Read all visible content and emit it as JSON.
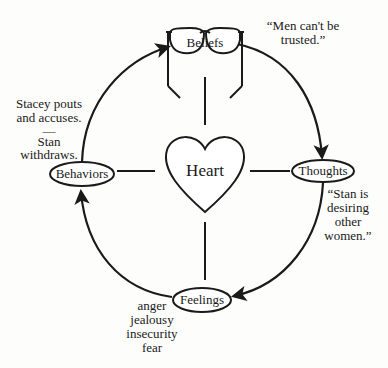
{
  "diagram": {
    "center": {
      "label": "Heart",
      "shape": "heart"
    },
    "nodes": [
      {
        "id": "beliefs",
        "label": "Beliefs",
        "shape": "eyeglasses",
        "annotation": [
          "“Men can't be",
          "trusted.”"
        ]
      },
      {
        "id": "thoughts",
        "label": "Thoughts",
        "shape": "ellipse",
        "annotation": [
          "“Stan is",
          "desiring",
          "other",
          "women.”"
        ]
      },
      {
        "id": "feelings",
        "label": "Feelings",
        "shape": "ellipse",
        "annotation": [
          "anger",
          "jealousy",
          "insecurity",
          "fear"
        ]
      },
      {
        "id": "behaviors",
        "label": "Behaviors",
        "shape": "ellipse",
        "annotation": [
          "Stacey pouts",
          "and accuses.",
          "—",
          "Stan",
          "withdraws."
        ]
      }
    ],
    "cycle_direction": "clockwise",
    "edges": [
      {
        "from": "beliefs",
        "to": "thoughts"
      },
      {
        "from": "thoughts",
        "to": "feelings"
      },
      {
        "from": "feelings",
        "to": "behaviors"
      },
      {
        "from": "behaviors",
        "to": "beliefs"
      }
    ],
    "spokes": [
      "heart-beliefs",
      "heart-thoughts",
      "heart-feelings",
      "heart-behaviors"
    ],
    "colors": {
      "line": "#1a1a1a",
      "background": "#fdfdfc"
    }
  }
}
